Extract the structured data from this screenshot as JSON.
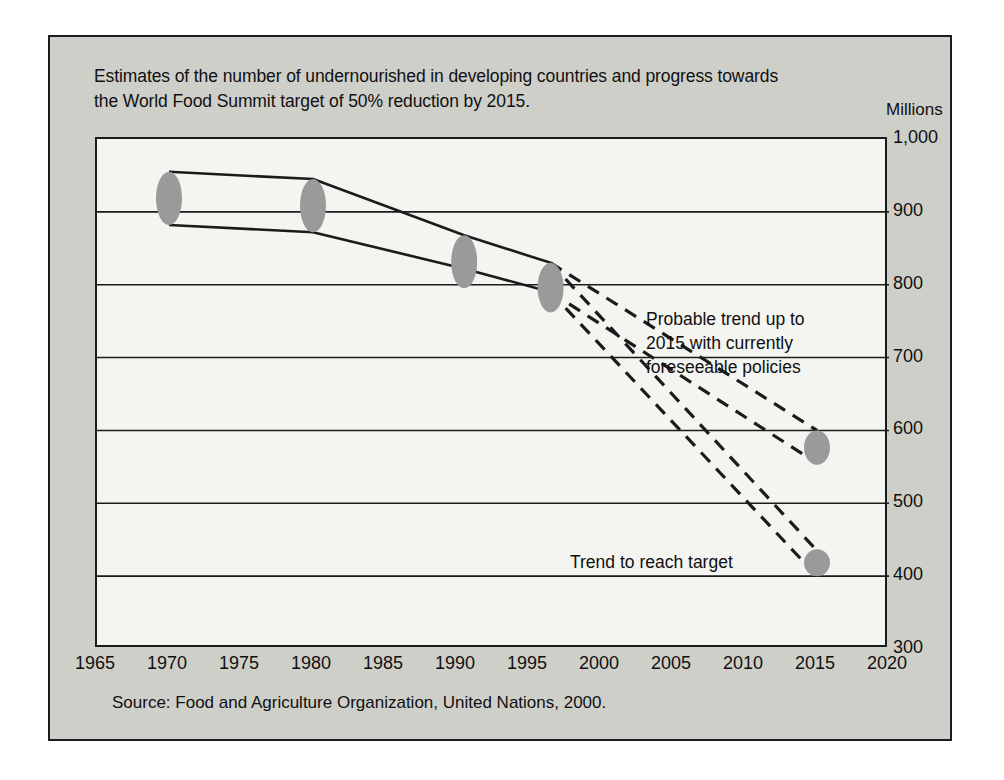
{
  "title": {
    "line1": "Estimates of the number of undernourished in developing countries and progress towards",
    "line2": "the World Food Summit target of 50% reduction by 2015."
  },
  "source_note": "Source:  Food and Agriculture Organization, United Nations, 2000.",
  "chart_data": {
    "type": "line",
    "title": "Estimates of the number of undernourished in developing countries and progress towards the World Food Summit target of 50% reduction by 2015.",
    "subtitle": "",
    "xlabel": "",
    "ylabel": "Millions",
    "unit_label": "Millions",
    "xlim": [
      1965,
      2020
    ],
    "ylim": [
      300,
      1000
    ],
    "xticks": [
      1965,
      1970,
      1975,
      1980,
      1985,
      1990,
      1995,
      2000,
      2005,
      2010,
      2015,
      2020
    ],
    "xtick_labels": [
      "1965",
      "1970",
      "1975",
      "1980",
      "1985",
      "1990",
      "1995",
      "2000",
      "2005",
      "2010",
      "2015",
      "2020"
    ],
    "yticks": [
      300,
      400,
      500,
      600,
      700,
      800,
      900,
      1000
    ],
    "ytick_labels": [
      "300",
      "400",
      "500",
      "600",
      "700",
      "800",
      "900",
      "1,000"
    ],
    "grid": "horizontal",
    "legend": "none",
    "series": [
      {
        "name": "Historical estimate range - upper bound",
        "style": "solid",
        "x": [
          1970,
          1980,
          1990.5,
          1996.5
        ],
        "values": [
          955,
          945,
          868,
          830
        ]
      },
      {
        "name": "Historical estimate range - lower bound",
        "style": "solid",
        "x": [
          1970,
          1980,
          1990.5,
          1996.5
        ],
        "values": [
          882,
          872,
          822,
          790
        ]
      },
      {
        "name": "Probable trend to 2015 with currently foreseeable policies - upper bound",
        "style": "dashed",
        "x": [
          1996.5,
          2015
        ],
        "values": [
          830,
          600
        ]
      },
      {
        "name": "Probable trend to 2015 with currently foreseeable policies - lower bound",
        "style": "dashed",
        "x": [
          1996.5,
          2015
        ],
        "values": [
          790,
          555
        ]
      },
      {
        "name": "Trend to reach target - upper bound",
        "style": "dashed",
        "x": [
          1996.5,
          2015
        ],
        "values": [
          830,
          435
        ]
      },
      {
        "name": "Trend to reach target - lower bound",
        "style": "dashed",
        "x": [
          1996.5,
          2015
        ],
        "values": [
          790,
          400
        ]
      }
    ],
    "markers": [
      {
        "name": "estimate-1970",
        "x": 1970,
        "y_top": 955,
        "y_bottom": 882
      },
      {
        "name": "estimate-1980",
        "x": 1980,
        "y_top": 945,
        "y_bottom": 872
      },
      {
        "name": "estimate-1990",
        "x": 1990.5,
        "y_top": 868,
        "y_bottom": 795
      },
      {
        "name": "estimate-1996",
        "x": 1996.5,
        "y_top": 830,
        "y_bottom": 762
      },
      {
        "name": "probable-2015",
        "x": 2015,
        "y_top": 600,
        "y_bottom": 553
      },
      {
        "name": "target-2015",
        "x": 2015,
        "y_top": 437,
        "y_bottom": 400
      }
    ],
    "annotations": [
      {
        "name": "probable-trend",
        "lines": [
          "Probable trend up to",
          "2015 with currently",
          "foreseeable policies"
        ]
      },
      {
        "name": "trend-to-target",
        "lines": [
          "Trend to reach target"
        ]
      }
    ],
    "colors": {
      "marker_fill": "#9a9a9a",
      "line": "#1b1b1b",
      "grid": "#1b1b1b",
      "plot_background": "#f4f4f1",
      "panel_background": "#cfcfca"
    }
  }
}
